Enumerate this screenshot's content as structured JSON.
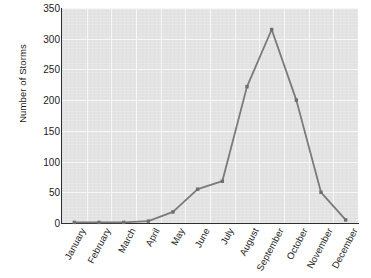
{
  "chart_data": {
    "type": "line",
    "title": "",
    "xlabel": "",
    "ylabel": "Number of Storms",
    "categories": [
      "January",
      "February",
      "March",
      "April",
      "May",
      "June",
      "July",
      "August",
      "September",
      "October",
      "November",
      "December"
    ],
    "values": [
      1,
      1,
      1,
      3,
      18,
      55,
      68,
      222,
      315,
      200,
      50,
      5
    ],
    "series": [
      {
        "name": "Number of Storms",
        "values": [
          1,
          1,
          1,
          3,
          18,
          55,
          68,
          222,
          315,
          200,
          50,
          5
        ]
      }
    ],
    "ylim": [
      0,
      350
    ],
    "y_ticks": [
      0,
      50,
      100,
      150,
      200,
      250,
      300,
      350
    ],
    "y_tick_labels": [
      "0",
      "50",
      "100",
      "150",
      "200",
      "250",
      "300",
      "350"
    ],
    "grid": true,
    "legend": "none",
    "marker": "square",
    "line_color": "#7a7a7a",
    "marker_color": "#6e6e6e",
    "plot_background_color": "#e3e3e3",
    "gridline_color": "#f7f7f7",
    "axis_color": "#2e2e2e",
    "text_color": "#1b1b1b"
  }
}
